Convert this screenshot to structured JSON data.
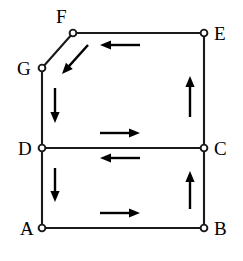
{
  "figure": {
    "kind": "directed-graph-diagram",
    "width": 243,
    "height": 261,
    "background_color": "#ffffff",
    "line_color": "#1a1a1a",
    "arrow_color": "#000000",
    "node_fill_color": "#ffffff"
  },
  "nodes": [
    {
      "id": "A",
      "label": "A",
      "x": 42,
      "y": 228,
      "label_x": 20,
      "label_y": 219
    },
    {
      "id": "B",
      "label": "B",
      "x": 204,
      "y": 228,
      "label_x": 214,
      "label_y": 219
    },
    {
      "id": "C",
      "label": "C",
      "x": 204,
      "y": 148,
      "label_x": 214,
      "label_y": 139
    },
    {
      "id": "D",
      "label": "D",
      "x": 42,
      "y": 148,
      "label_x": 18,
      "label_y": 139
    },
    {
      "id": "E",
      "label": "E",
      "x": 204,
      "y": 33,
      "label_x": 214,
      "label_y": 24
    },
    {
      "id": "F",
      "label": "F",
      "x": 73,
      "y": 33,
      "label_x": 56,
      "label_y": 7
    },
    {
      "id": "G",
      "label": "G",
      "x": 42,
      "y": 68,
      "label_x": 17,
      "label_y": 59
    }
  ],
  "edges": [
    {
      "from": "F",
      "to": "E",
      "orientation": "horizontal",
      "x1": 73,
      "y1": 33,
      "x2": 204,
      "y2": 33
    },
    {
      "from": "E",
      "to": "C",
      "orientation": "vertical",
      "x1": 204,
      "y1": 33,
      "x2": 204,
      "y2": 148
    },
    {
      "from": "G",
      "to": "F",
      "orientation": "diagonal",
      "x1": 42,
      "y1": 68,
      "x2": 73,
      "y2": 33
    },
    {
      "from": "G",
      "to": "D",
      "orientation": "vertical",
      "x1": 42,
      "y1": 68,
      "x2": 42,
      "y2": 148
    },
    {
      "from": "D",
      "to": "C",
      "orientation": "horizontal",
      "x1": 42,
      "y1": 148,
      "x2": 204,
      "y2": 148
    },
    {
      "from": "D",
      "to": "A",
      "orientation": "vertical",
      "x1": 42,
      "y1": 148,
      "x2": 42,
      "y2": 228
    },
    {
      "from": "A",
      "to": "B",
      "orientation": "horizontal",
      "x1": 42,
      "y1": 228,
      "x2": 204,
      "y2": 228
    },
    {
      "from": "B",
      "to": "C",
      "orientation": "vertical",
      "x1": 204,
      "y1": 228,
      "x2": 204,
      "y2": 148
    }
  ],
  "direction_arrows": [
    {
      "name": "arrow-E-to-F",
      "edge": "F-E",
      "direction": "left",
      "x1": 140,
      "y1": 45,
      "x2": 100,
      "y2": 45
    },
    {
      "name": "arrow-F-to-G",
      "edge": "G-F",
      "direction": "down-left",
      "x1": 88,
      "y1": 45,
      "x2": 62,
      "y2": 74
    },
    {
      "name": "arrow-G-to-D",
      "edge": "G-D",
      "direction": "down",
      "x1": 55,
      "y1": 88,
      "x2": 55,
      "y2": 123
    },
    {
      "name": "arrow-C-to-E",
      "edge": "E-C",
      "direction": "up",
      "x1": 190,
      "y1": 117,
      "x2": 190,
      "y2": 76
    },
    {
      "name": "arrow-D-to-C",
      "edge": "D-C",
      "direction": "right",
      "x1": 100,
      "y1": 133,
      "x2": 140,
      "y2": 133
    },
    {
      "name": "arrow-C-to-D",
      "edge": "D-C",
      "direction": "left",
      "x1": 140,
      "y1": 158,
      "x2": 100,
      "y2": 158
    },
    {
      "name": "arrow-D-to-A",
      "edge": "D-A",
      "direction": "down",
      "x1": 55,
      "y1": 168,
      "x2": 55,
      "y2": 202
    },
    {
      "name": "arrow-B-to-C",
      "edge": "B-C",
      "direction": "up",
      "x1": 190,
      "y1": 209,
      "x2": 190,
      "y2": 171
    },
    {
      "name": "arrow-A-to-B",
      "edge": "A-B",
      "direction": "right",
      "x1": 100,
      "y1": 213,
      "x2": 140,
      "y2": 213
    }
  ]
}
